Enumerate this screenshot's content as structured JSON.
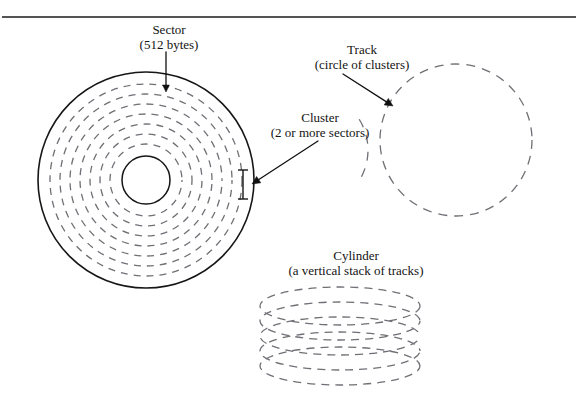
{
  "figure": {
    "background_color": "#ffffff",
    "rule": {
      "name": "top-horizontal-rule",
      "x1": 2,
      "y1": 17,
      "x2": 576,
      "y2": 17,
      "color": "#1b1b1b",
      "width": 1.6
    },
    "colors": {
      "solid_stroke": "#161616",
      "dashed_stroke": "#6f6f75",
      "arrow_stroke": "#111111",
      "text": "#131313"
    }
  },
  "labels": {
    "sector": {
      "line1": "Sector",
      "line2": "(512 bytes)"
    },
    "cluster": {
      "line1": "Cluster",
      "line2": "(2 or more sectors)"
    },
    "track": {
      "line1": "Track",
      "line2": "(circle of clusters)"
    },
    "cylinder": {
      "line1": "Cylinder",
      "line2": "(a vertical stack of tracks)"
    }
  },
  "diagram_data": {
    "type": "diagram",
    "platter": {
      "name": "disk-platter",
      "center_x": 146,
      "center_y": 180,
      "outer_radius": 108,
      "hub_radius": 24,
      "outer_stroke": "#161616",
      "outer_stroke_width": 1.6,
      "hub_stroke": "#161616",
      "hub_stroke_width": 1.5,
      "track_radii": [
        96,
        86,
        76,
        66,
        56,
        46,
        36
      ],
      "track_stroke": "#6f6f75",
      "track_stroke_width": 1.3,
      "track_dash": "7 6"
    },
    "track_circle": {
      "name": "track-circle",
      "center_x": 456,
      "center_y": 140,
      "radius": 76,
      "stroke": "#6f6f75",
      "stroke_width": 1.3,
      "dash": "9 7"
    },
    "loose_arc": {
      "name": "loose-track-arc",
      "center_x": 310,
      "center_y": 150,
      "radius": 58,
      "stroke": "#6f6f75",
      "stroke_width": 1.3,
      "dash": "9 8",
      "start_deg": 58,
      "end_deg": 122
    },
    "cylinder": {
      "name": "cylinder-stack",
      "center_x": 340,
      "top_y": 306,
      "rx": 80,
      "ry": 19,
      "layer_count": 5,
      "layer_gap": 15,
      "stroke": "#6f6f75",
      "stroke_width": 1.3,
      "dash": "8 6"
    },
    "cluster_marker": {
      "name": "cluster-extent-marker",
      "x": 243,
      "y_top": 170,
      "y_bottom": 199,
      "serif_half_width": 5,
      "stroke": "#161616",
      "stroke_width": 1.4
    },
    "arrows": [
      {
        "name": "sector-arrow",
        "x1": 166,
        "y1": 52,
        "x2": 166,
        "y2": 92,
        "stroke": "#111111",
        "stroke_width": 1.3,
        "head_size": 7
      },
      {
        "name": "cluster-arrow",
        "x1": 318,
        "y1": 141,
        "x2": 252,
        "y2": 184,
        "stroke": "#111111",
        "stroke_width": 1.3,
        "head_size": 8
      },
      {
        "name": "track-arrow",
        "x1": 343,
        "y1": 74,
        "x2": 393,
        "y2": 106,
        "stroke": "#111111",
        "stroke_width": 1.3,
        "head_size": 8
      }
    ]
  }
}
